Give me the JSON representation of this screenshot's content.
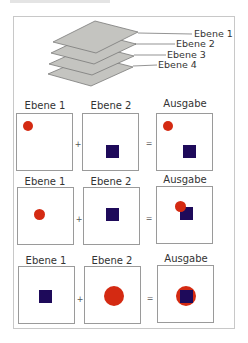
{
  "colors": {
    "red": "#d42a12",
    "blue": "#1e0a5a",
    "layer_fill": "#c4c4c0",
    "layer_stroke": "#7a7a78",
    "frame": "#c8c8c8"
  },
  "stack": {
    "labels": [
      "Ebene 1",
      "Ebene 2",
      "Ebene 3",
      "Ebene 4"
    ]
  },
  "rows": [
    {
      "labels": [
        "Ebene 1",
        "Ebene 2",
        "Ausgabe"
      ],
      "operators": [
        "+",
        "="
      ],
      "description": "Layer 1 red circle top-left, Layer 2 blue square bottom-right; output shows both separate"
    },
    {
      "labels": [
        "Ebene 1",
        "Ebene 2",
        "Ausgabe"
      ],
      "operators": [
        "+",
        "="
      ],
      "description": "Layer 1 red circle center, Layer 2 blue square center; output shows red circle over blue square"
    },
    {
      "labels": [
        "Ebene 1",
        "Ebene 2",
        "Ausgabe"
      ],
      "operators": [
        "+",
        "="
      ],
      "description": "Layer 1 blue square center, Layer 2 large red circle center; output shows blue square over red circle"
    }
  ]
}
